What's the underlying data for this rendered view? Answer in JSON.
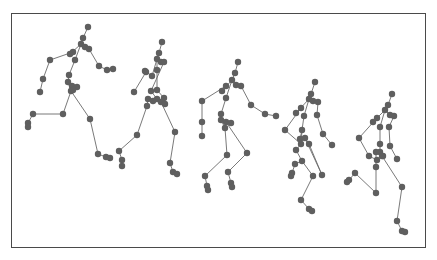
{
  "figure": {
    "colors": {
      "border": "#4a4a4a",
      "bone": "#6a6a6a",
      "joint": "#5f5f5f",
      "background": "#ffffff"
    },
    "joint_radius": 3.2,
    "skeletons": [
      {
        "joints": [
          [
            88,
            27
          ],
          [
            83,
            38
          ],
          [
            81,
            44
          ],
          [
            85,
            47
          ],
          [
            89,
            49
          ],
          [
            73,
            52
          ],
          [
            70,
            54
          ],
          [
            75,
            60
          ],
          [
            50,
            60
          ],
          [
            99,
            66
          ],
          [
            107,
            70
          ],
          [
            113,
            69
          ],
          [
            43,
            79
          ],
          [
            40,
            92
          ],
          [
            69,
            75
          ],
          [
            68,
            82
          ],
          [
            72,
            86
          ],
          [
            77,
            87
          ],
          [
            71,
            91
          ],
          [
            73,
            90
          ],
          [
            63,
            114
          ],
          [
            33,
            114
          ],
          [
            28,
            123
          ],
          [
            28,
            127
          ],
          [
            90,
            119
          ],
          [
            98,
            154
          ],
          [
            106,
            157
          ],
          [
            110,
            158
          ]
        ],
        "bones": [
          [
            0,
            1
          ],
          [
            1,
            2
          ],
          [
            2,
            3
          ],
          [
            3,
            4
          ],
          [
            2,
            6
          ],
          [
            2,
            7
          ],
          [
            4,
            9
          ],
          [
            9,
            10
          ],
          [
            10,
            11
          ],
          [
            6,
            5
          ],
          [
            5,
            8
          ],
          [
            8,
            12
          ],
          [
            12,
            13
          ],
          [
            7,
            14
          ],
          [
            14,
            15
          ],
          [
            15,
            16
          ],
          [
            16,
            17
          ],
          [
            15,
            18
          ],
          [
            18,
            20
          ],
          [
            20,
            21
          ],
          [
            21,
            22
          ],
          [
            22,
            23
          ],
          [
            18,
            24
          ],
          [
            24,
            25
          ],
          [
            25,
            26
          ],
          [
            26,
            27
          ]
        ]
      },
      {
        "joints": [
          [
            162,
            42
          ],
          [
            159,
            53
          ],
          [
            157,
            59
          ],
          [
            161,
            62
          ],
          [
            164,
            62
          ],
          [
            157,
            70
          ],
          [
            152,
            76
          ],
          [
            145,
            71
          ],
          [
            146,
            72
          ],
          [
            157,
            90
          ],
          [
            151,
            91
          ],
          [
            157,
            99
          ],
          [
            164,
            98
          ],
          [
            134,
            92
          ],
          [
            148,
            99
          ],
          [
            153,
            101
          ],
          [
            161,
            102
          ],
          [
            165,
            104
          ],
          [
            147,
            106
          ],
          [
            137,
            135
          ],
          [
            119,
            151
          ],
          [
            122,
            160
          ],
          [
            122,
            166
          ],
          [
            175,
            132
          ],
          [
            170,
            163
          ],
          [
            173,
            172
          ],
          [
            177,
            174
          ]
        ],
        "bones": [
          [
            0,
            1
          ],
          [
            1,
            2
          ],
          [
            2,
            3
          ],
          [
            3,
            4
          ],
          [
            2,
            5
          ],
          [
            2,
            6
          ],
          [
            6,
            7
          ],
          [
            7,
            8
          ],
          [
            5,
            9
          ],
          [
            4,
            10
          ],
          [
            10,
            11
          ],
          [
            9,
            12
          ],
          [
            8,
            13
          ],
          [
            11,
            14
          ],
          [
            14,
            15
          ],
          [
            15,
            16
          ],
          [
            16,
            17
          ],
          [
            14,
            18
          ],
          [
            18,
            19
          ],
          [
            19,
            20
          ],
          [
            20,
            21
          ],
          [
            21,
            22
          ],
          [
            16,
            23
          ],
          [
            23,
            24
          ],
          [
            24,
            25
          ],
          [
            25,
            26
          ]
        ]
      },
      {
        "joints": [
          [
            238,
            62
          ],
          [
            235,
            73
          ],
          [
            232,
            80
          ],
          [
            236,
            85
          ],
          [
            241,
            86
          ],
          [
            226,
            86
          ],
          [
            222,
            91
          ],
          [
            226,
            98
          ],
          [
            202,
            101
          ],
          [
            251,
            105
          ],
          [
            265,
            114
          ],
          [
            276,
            116
          ],
          [
            202,
            122
          ],
          [
            202,
            136
          ],
          [
            221,
            114
          ],
          [
            221,
            120
          ],
          [
            226,
            122
          ],
          [
            231,
            123
          ],
          [
            225,
            128
          ],
          [
            227,
            155
          ],
          [
            247,
            153
          ],
          [
            205,
            176
          ],
          [
            207,
            186
          ],
          [
            208,
            190
          ],
          [
            228,
            172
          ],
          [
            231,
            183
          ],
          [
            232,
            187
          ]
        ],
        "bones": [
          [
            0,
            1
          ],
          [
            1,
            2
          ],
          [
            2,
            3
          ],
          [
            3,
            4
          ],
          [
            2,
            7
          ],
          [
            2,
            6
          ],
          [
            6,
            5
          ],
          [
            5,
            8
          ],
          [
            8,
            12
          ],
          [
            12,
            13
          ],
          [
            4,
            9
          ],
          [
            9,
            10
          ],
          [
            10,
            11
          ],
          [
            7,
            14
          ],
          [
            14,
            15
          ],
          [
            15,
            16
          ],
          [
            16,
            17
          ],
          [
            15,
            18
          ],
          [
            18,
            19
          ],
          [
            19,
            21
          ],
          [
            21,
            22
          ],
          [
            22,
            23
          ],
          [
            16,
            20
          ],
          [
            20,
            24
          ],
          [
            24,
            25
          ],
          [
            25,
            26
          ]
        ]
      },
      {
        "joints": [
          [
            315,
            82
          ],
          [
            311,
            94
          ],
          [
            309,
            99
          ],
          [
            313,
            101
          ],
          [
            318,
            102
          ],
          [
            301,
            108
          ],
          [
            296,
            113
          ],
          [
            304,
            116
          ],
          [
            285,
            130
          ],
          [
            317,
            115
          ],
          [
            323,
            134
          ],
          [
            332,
            145
          ],
          [
            302,
            130
          ],
          [
            300,
            139
          ],
          [
            305,
            138
          ],
          [
            309,
            144
          ],
          [
            301,
            144
          ],
          [
            296,
            150
          ],
          [
            302,
            161
          ],
          [
            295,
            164
          ],
          [
            292,
            173
          ],
          [
            291,
            176
          ],
          [
            322,
            175
          ],
          [
            313,
            176
          ],
          [
            301,
            200
          ],
          [
            309,
            209
          ],
          [
            312,
            211
          ]
        ],
        "bones": [
          [
            0,
            1
          ],
          [
            1,
            2
          ],
          [
            2,
            3
          ],
          [
            3,
            4
          ],
          [
            2,
            7
          ],
          [
            2,
            6
          ],
          [
            6,
            5
          ],
          [
            5,
            8
          ],
          [
            8,
            16
          ],
          [
            4,
            9
          ],
          [
            9,
            10
          ],
          [
            10,
            11
          ],
          [
            7,
            12
          ],
          [
            12,
            13
          ],
          [
            13,
            14
          ],
          [
            14,
            15
          ],
          [
            12,
            16
          ],
          [
            16,
            17
          ],
          [
            17,
            18
          ],
          [
            18,
            19
          ],
          [
            19,
            20
          ],
          [
            20,
            21
          ],
          [
            14,
            22
          ],
          [
            15,
            22
          ],
          [
            18,
            23
          ],
          [
            23,
            24
          ],
          [
            24,
            25
          ],
          [
            25,
            26
          ]
        ]
      },
      {
        "joints": [
          [
            392,
            94
          ],
          [
            388,
            105
          ],
          [
            385,
            110
          ],
          [
            390,
            115
          ],
          [
            394,
            116
          ],
          [
            377,
            118
          ],
          [
            373,
            122
          ],
          [
            380,
            127
          ],
          [
            359,
            138
          ],
          [
            389,
            127
          ],
          [
            390,
            146
          ],
          [
            397,
            159
          ],
          [
            380,
            144
          ],
          [
            380,
            152
          ],
          [
            383,
            156
          ],
          [
            376,
            152
          ],
          [
            382,
            156
          ],
          [
            377,
            160
          ],
          [
            369,
            156
          ],
          [
            376,
            167
          ],
          [
            355,
            173
          ],
          [
            349,
            180
          ],
          [
            347,
            182
          ],
          [
            402,
            187
          ],
          [
            376,
            193
          ],
          [
            397,
            221
          ],
          [
            402,
            231
          ],
          [
            405,
            232
          ]
        ],
        "bones": [
          [
            0,
            1
          ],
          [
            1,
            2
          ],
          [
            2,
            3
          ],
          [
            3,
            4
          ],
          [
            2,
            7
          ],
          [
            2,
            6
          ],
          [
            6,
            5
          ],
          [
            5,
            8
          ],
          [
            8,
            18
          ],
          [
            18,
            17
          ],
          [
            4,
            9
          ],
          [
            9,
            10
          ],
          [
            10,
            11
          ],
          [
            7,
            12
          ],
          [
            12,
            13
          ],
          [
            13,
            14
          ],
          [
            13,
            15
          ],
          [
            15,
            19
          ],
          [
            19,
            24
          ],
          [
            24,
            20
          ],
          [
            20,
            21
          ],
          [
            21,
            22
          ],
          [
            14,
            16
          ],
          [
            16,
            23
          ],
          [
            23,
            25
          ],
          [
            25,
            26
          ],
          [
            26,
            27
          ]
        ]
      }
    ]
  }
}
